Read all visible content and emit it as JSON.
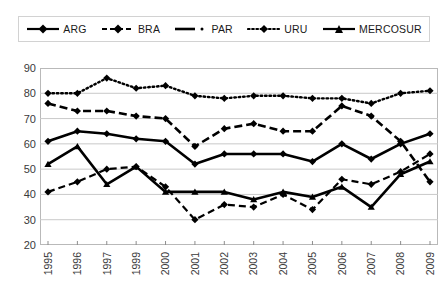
{
  "legend": {
    "position": "top",
    "items": [
      {
        "label": "ARG",
        "key": "line-solid-diamond",
        "color": "#000000"
      },
      {
        "label": "BRA",
        "key": "line-dashed-open-diamond",
        "color": "#000000"
      },
      {
        "label": "PAR",
        "key": "line-dashed-diamond",
        "color": "#000000"
      },
      {
        "label": "URU",
        "key": "line-dotted-diamond",
        "color": "#000000"
      },
      {
        "label": "MERCOSUR",
        "key": "line-solid-triangle",
        "color": "#000000"
      }
    ]
  },
  "chart_data": {
    "type": "line",
    "title": "",
    "subtitle": "",
    "xlabel": "",
    "ylabel": "",
    "ylim": [
      20,
      90
    ],
    "yticks": [
      20,
      30,
      40,
      50,
      60,
      70,
      80,
      90
    ],
    "grid": true,
    "x": [
      "1995",
      "1996",
      "1997",
      "1999",
      "2000",
      "2001",
      "2002",
      "2003",
      "2004",
      "2005",
      "2006",
      "2007",
      "2008",
      "2009"
    ],
    "categories": [
      "1995",
      "1996",
      "1997",
      "1999",
      "2000",
      "2001",
      "2002",
      "2003",
      "2004",
      "2005",
      "2006",
      "2007",
      "2008",
      "2009"
    ],
    "series": [
      {
        "name": "ARG",
        "style": "solid-thick",
        "marker": "diamond",
        "values": [
          61,
          65,
          64,
          62,
          61,
          52,
          56,
          56,
          56,
          53,
          60,
          54,
          60,
          64
        ]
      },
      {
        "name": "BRA",
        "style": "dashed-open",
        "marker": "open-diamond",
        "values": [
          41,
          45,
          50,
          51,
          43,
          30,
          36,
          35,
          40,
          34,
          46,
          44,
          49,
          56
        ]
      },
      {
        "name": "PAR",
        "style": "dashed",
        "marker": "diamond",
        "values": [
          76,
          73,
          73,
          71,
          70,
          59,
          66,
          68,
          65,
          65,
          75,
          71,
          61,
          45
        ]
      },
      {
        "name": "URU",
        "style": "dotted",
        "marker": "diamond",
        "values": [
          80,
          80,
          86,
          82,
          83,
          79,
          78,
          79,
          79,
          78,
          78,
          76,
          80,
          81
        ]
      },
      {
        "name": "MERCOSUR",
        "style": "solid-thick",
        "marker": "triangle",
        "values": [
          52,
          59,
          44,
          51,
          41,
          41,
          41,
          38,
          41,
          39,
          43,
          35,
          48,
          53
        ]
      }
    ]
  }
}
